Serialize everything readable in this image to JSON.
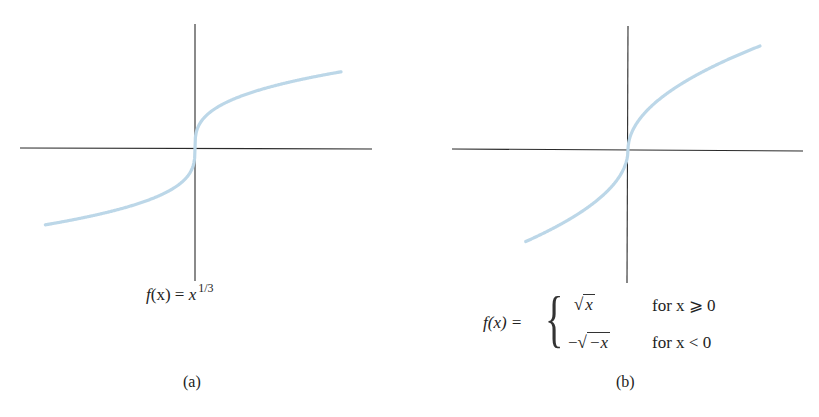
{
  "chart_data": [
    {
      "type": "line",
      "panel": "(a)",
      "title": "f(x) = x^{1/3}",
      "caption": "(a)",
      "function": "x^(1/3)",
      "xlabel": "",
      "ylabel": "",
      "ticks": "none",
      "grid": false,
      "legend": "none",
      "curve_color": "#bcd7e8",
      "axes_color": "#2a2a2a",
      "x": [
        -4,
        -3,
        -2,
        -1,
        -0.5,
        -0.1,
        0,
        0.1,
        0.5,
        1,
        2,
        3,
        4
      ],
      "values": [
        -1.587,
        -1.442,
        -1.26,
        -1.0,
        -0.794,
        -0.464,
        0,
        0.464,
        0.794,
        1.0,
        1.26,
        1.442,
        1.587
      ]
    },
    {
      "type": "line",
      "panel": "(b)",
      "title": "f(x) = { sqrt(x) for x >= 0 ; -sqrt(-x) for x < 0 }",
      "caption": "(b)",
      "function": "sign(x)*sqrt(|x|)",
      "xlabel": "",
      "ylabel": "",
      "ticks": "none",
      "grid": false,
      "legend": "none",
      "curve_color": "#bcd7e8",
      "axes_color": "#2a2a2a",
      "x": [
        -4,
        -3,
        -2,
        -1,
        -0.5,
        0,
        0.5,
        1,
        2,
        3,
        4
      ],
      "values": [
        -2.0,
        -1.732,
        -1.414,
        -1.0,
        -0.707,
        0,
        0.707,
        1.0,
        1.414,
        1.732,
        2.0
      ]
    }
  ],
  "panel_a": {
    "formula_lhs": "f",
    "formula_paren": "(x) = ",
    "formula_var": "x",
    "formula_exp": "1/3",
    "caption": "(a)"
  },
  "panel_b": {
    "formula_lhs": "f(x) =",
    "brace": "{",
    "row1_expr": "x",
    "row1_cond": "for x ⩾ 0",
    "row2_minus": "−",
    "row2_expr": "−x",
    "row2_cond": "for x < 0",
    "caption": "(b)"
  }
}
